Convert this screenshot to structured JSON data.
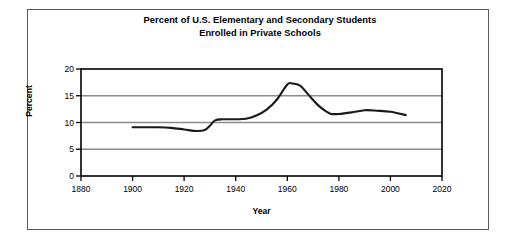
{
  "figure": {
    "title_line1": "Percent of U.S. Elementary and Secondary Students",
    "title_line2": "Enrolled in Private Schools",
    "frame_color": "#5a5a5a",
    "grid_color": "#8c8c8c",
    "axis_color": "#000000",
    "line_color": "#1a1a1a",
    "background": "#ffffff"
  },
  "chart_data": {
    "type": "line",
    "title": "Percent of U.S. Elementary and Secondary Students Enrolled in Private Schools",
    "xlabel": "Year",
    "ylabel": "Percent",
    "xlim": [
      1880,
      2020
    ],
    "ylim": [
      0,
      20
    ],
    "xticks": [
      1880,
      1900,
      1920,
      1940,
      1960,
      1980,
      2000,
      2020
    ],
    "xtick_labels": [
      "1880",
      "1900",
      "1920",
      "1940",
      "1960",
      "1980",
      "2000",
      "2020"
    ],
    "yticks": [
      0,
      5,
      10,
      15,
      20
    ],
    "ytick_labels": [
      "0",
      "5",
      "10",
      "15",
      "20"
    ],
    "grid": "horizontal",
    "legend": "none",
    "series": [
      {
        "name": "Percent enrolled in private schools",
        "x": [
          1900,
          1905,
          1910,
          1915,
          1920,
          1925,
          1928,
          1930,
          1932,
          1935,
          1940,
          1944,
          1948,
          1952,
          1956,
          1960,
          1962,
          1965,
          1968,
          1972,
          1975,
          1977,
          1980,
          1985,
          1990,
          1995,
          2000,
          2006
        ],
        "values": [
          9.1,
          9.1,
          9.1,
          9.0,
          8.7,
          8.4,
          8.6,
          9.4,
          10.4,
          10.6,
          10.6,
          10.7,
          11.3,
          12.4,
          14.3,
          17.1,
          17.3,
          16.9,
          15.3,
          13.2,
          12.1,
          11.6,
          11.6,
          11.9,
          12.3,
          12.2,
          12.0,
          11.4
        ]
      }
    ]
  },
  "axis": {
    "y_label": "Percent",
    "x_label": "Year"
  }
}
